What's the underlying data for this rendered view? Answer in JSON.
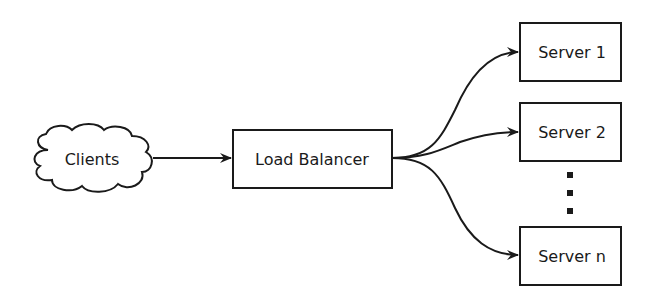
{
  "diagram": {
    "nodes": {
      "clients": {
        "label": "Clients",
        "shape": "cloud"
      },
      "load_balancer": {
        "label": "Load Balancer",
        "shape": "rectangle"
      },
      "server_1": {
        "label": "Server 1",
        "shape": "rectangle"
      },
      "server_2": {
        "label": "Server 2",
        "shape": "rectangle"
      },
      "server_n": {
        "label": "Server n",
        "shape": "rectangle"
      }
    },
    "ellipsis": "vertical-dots",
    "edges": [
      {
        "from": "Clients",
        "to": "Load Balancer"
      },
      {
        "from": "Load Balancer",
        "to": "Server 1"
      },
      {
        "from": "Load Balancer",
        "to": "Server 2"
      },
      {
        "from": "Load Balancer",
        "to": "Server n"
      }
    ],
    "colors": {
      "stroke": "#1a1a1a",
      "background": "#ffffff"
    }
  }
}
